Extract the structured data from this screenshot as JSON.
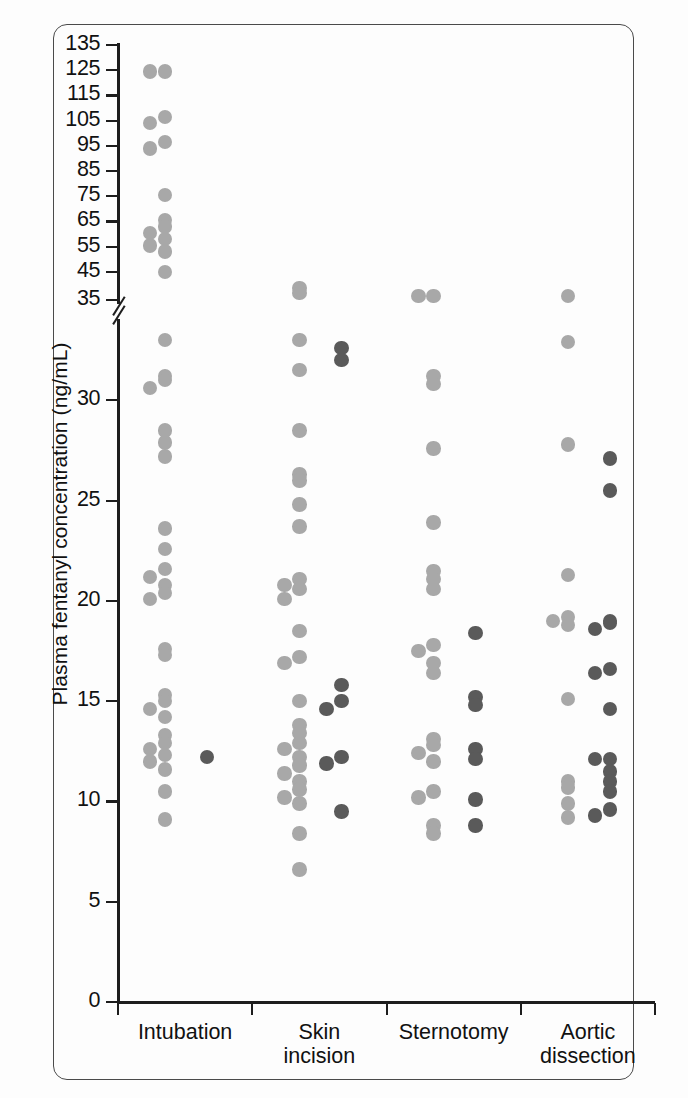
{
  "figure": {
    "y_axis_title": "Plasma fentanyl concentration (ng/mL)",
    "colors": {
      "light_group": "#a8a8a8",
      "dark_group": "#5a5a5a",
      "axis": "#1d1d1d",
      "frame": "#4a4a4a",
      "background": "#fdfdfd"
    }
  },
  "chart_data": {
    "type": "scatter",
    "title": "",
    "xlabel": "",
    "ylabel": "Plasma fentanyl concentration (ng/mL)",
    "broken_axis": true,
    "axis_break_between": [
      35,
      45
    ],
    "lower_ylim": [
      0,
      35
    ],
    "upper_ylim": [
      35,
      135
    ],
    "grid": false,
    "legend": "none",
    "ytick_labels_lower": [
      "0",
      "5",
      "10",
      "15",
      "20",
      "25",
      "30"
    ],
    "ytick_labels_upper": [
      "35",
      "45",
      "55",
      "65",
      "75",
      "85",
      "95",
      "105",
      "115",
      "125",
      "135"
    ],
    "categories": [
      "Intubation",
      "Skin incision",
      "Sternotomy",
      "Aortic dissection"
    ],
    "category_labels_multiline": [
      [
        "Intubation"
      ],
      [
        "Skin",
        "incision"
      ],
      [
        "Sternotomy"
      ],
      [
        "Aortic",
        "dissection"
      ]
    ],
    "series": [
      {
        "name": "light-group",
        "color": "#a8a8a8",
        "points": {
          "Intubation": [
            124.5,
            124.5,
            106.5,
            104.0,
            96.5,
            94.0,
            75.5,
            65.5,
            63.0,
            60.5,
            58.0,
            55.5,
            53.0,
            45.0,
            33.0,
            31.2,
            31.0,
            30.6,
            28.5,
            27.9,
            27.2,
            23.6,
            22.6,
            21.6,
            21.2,
            20.8,
            20.4,
            20.1,
            17.6,
            17.3,
            15.3,
            15.0,
            14.6,
            14.2,
            13.3,
            12.9,
            12.6,
            12.3,
            12.0,
            11.6,
            10.5,
            9.1
          ]
        }
      },
      {
        "name": "dark-group",
        "color": "#5a5a5a",
        "points": {
          "Intubation": [
            12.2
          ]
        }
      },
      {
        "name": "light-group-2",
        "color": "#a8a8a8",
        "points": {
          "Skin incision": [
            38.5,
            36.5,
            33.0,
            31.5,
            28.5,
            26.3,
            26.0,
            24.8,
            23.7,
            21.1,
            20.8,
            20.6,
            20.1,
            18.5,
            17.2,
            16.9,
            15.0,
            13.8,
            13.4,
            12.9,
            12.6,
            12.2,
            11.8,
            11.4,
            11.0,
            10.6,
            10.2,
            9.9,
            8.4,
            6.6
          ]
        }
      },
      {
        "name": "dark-group-2",
        "color": "#5a5a5a",
        "points": {
          "Skin incision": [
            32.6,
            32.0,
            15.8,
            15.0,
            14.6,
            12.2,
            11.9,
            9.5
          ]
        }
      },
      {
        "name": "light-group-3",
        "color": "#a8a8a8",
        "points": {
          "Sternotomy": [
            35.5,
            35.3,
            31.2,
            30.8,
            27.6,
            23.9,
            21.5,
            21.1,
            20.6,
            17.8,
            17.5,
            16.9,
            16.4,
            13.1,
            12.8,
            12.4,
            12.0,
            10.5,
            10.2,
            8.8,
            8.4
          ]
        }
      },
      {
        "name": "dark-group-3",
        "color": "#5a5a5a",
        "points": {
          "Sternotomy": [
            18.4,
            15.2,
            14.8,
            12.6,
            12.1,
            10.1,
            8.8
          ]
        }
      },
      {
        "name": "light-group-4",
        "color": "#a8a8a8",
        "points": {
          "Aortic dissection": [
            35.4,
            32.9,
            27.8,
            21.3,
            19.2,
            19.0,
            18.8,
            15.1,
            11.0,
            10.7,
            9.9,
            9.2
          ]
        }
      },
      {
        "name": "dark-group-4",
        "color": "#5a5a5a",
        "points": {
          "Aortic dissection": [
            27.1,
            25.5,
            19.0,
            18.9,
            18.6,
            16.6,
            16.4,
            14.6,
            12.1,
            12.1,
            11.5,
            11.0,
            10.5,
            9.6,
            9.3
          ]
        }
      }
    ]
  }
}
